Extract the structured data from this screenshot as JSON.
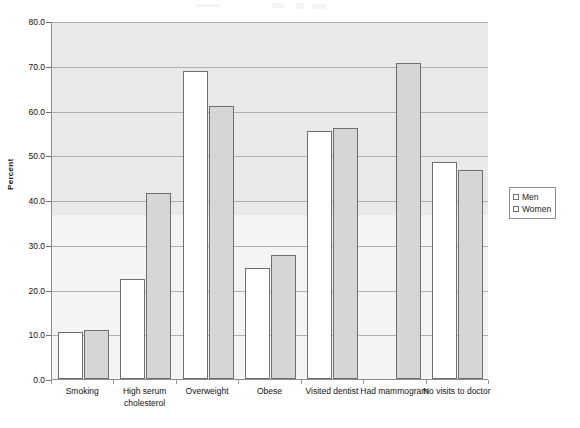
{
  "chart_data": {
    "type": "bar",
    "title": "",
    "subtitle": "",
    "xlabel": "",
    "ylabel": "Percent",
    "ylim": [
      0.0,
      80.0
    ],
    "ytick_labels": [
      "0.0",
      "10.0",
      "20.0",
      "30.0",
      "40.0",
      "50.0",
      "60.0",
      "70.0",
      "80.0"
    ],
    "ytick_values": [
      0,
      10,
      20,
      30,
      40,
      50,
      60,
      70,
      80
    ],
    "grid": "horizontal",
    "legend_position": "right",
    "categories": [
      "Smoking",
      "High serum cholesterol",
      "Overweight",
      "Obese",
      "Visited dentist",
      "Had mammogram",
      "No visits to doctor"
    ],
    "series": [
      {
        "name": "Men",
        "color": "#ffffff",
        "values": [
          10.6,
          22.3,
          68.9,
          24.9,
          55.4,
          null,
          48.5
        ]
      },
      {
        "name": "Women",
        "color": "#d6d6d6",
        "values": [
          11.0,
          41.6,
          60.9,
          27.7,
          56.2,
          70.6,
          46.6
        ]
      }
    ]
  },
  "legend": {
    "items": [
      {
        "label": "Men"
      },
      {
        "label": "Women"
      }
    ]
  },
  "axis": {
    "y_title": "Percent"
  },
  "colors": {
    "plot_background": "#e9e9e9",
    "bar_men": "#ffffff",
    "bar_women": "#d6d6d6",
    "bar_border": "#6f6f6f",
    "gridline": "#9a9a9a"
  }
}
